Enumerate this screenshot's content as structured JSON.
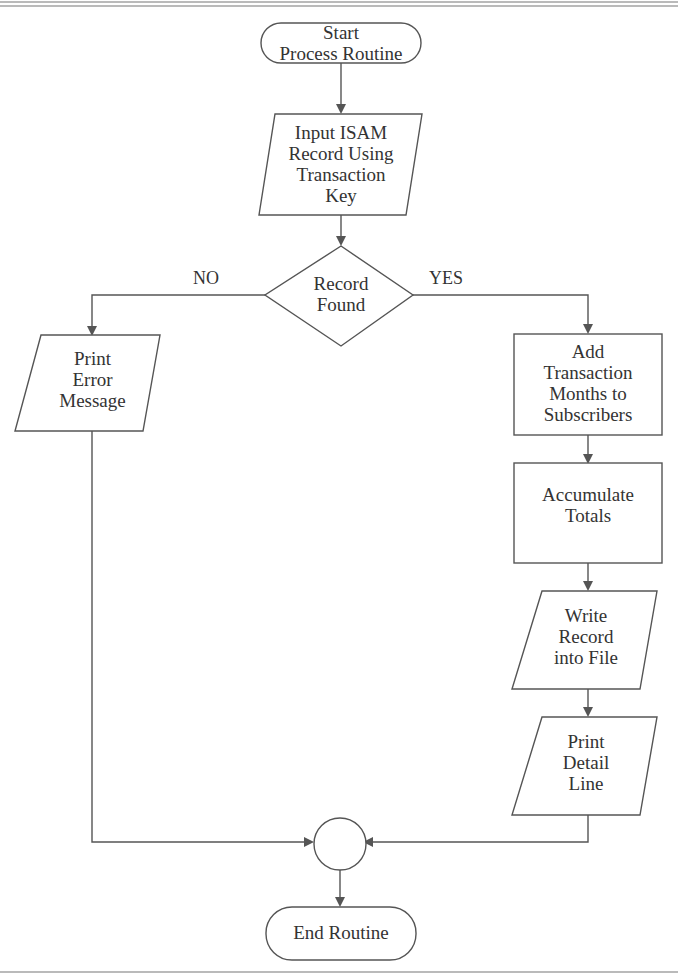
{
  "flowchart": {
    "start": {
      "type": "terminator",
      "label": "Start\nProcess Routine"
    },
    "input": {
      "type": "input-output",
      "label": "Input ISAM\nRecord Using\nTransaction\nKey"
    },
    "decision": {
      "type": "decision",
      "label": "Record\nFound",
      "no_label": "NO",
      "yes_label": "YES"
    },
    "error": {
      "type": "input-output",
      "label": "Print\nError\nMessage"
    },
    "add_months": {
      "type": "process",
      "label": "Add\nTransaction\nMonths to\nSubscribers"
    },
    "accumulate": {
      "type": "process",
      "label": "Accumulate\nTotals"
    },
    "write_record": {
      "type": "input-output",
      "label": "Write\nRecord\ninto File"
    },
    "print_detail": {
      "type": "input-output",
      "label": "Print\nDetail\nLine"
    },
    "connector": {
      "type": "connector",
      "label": ""
    },
    "end": {
      "type": "terminator",
      "label": "End Routine"
    }
  },
  "colors": {
    "stroke": "#555555",
    "text": "#333333",
    "background": "#ffffff"
  }
}
